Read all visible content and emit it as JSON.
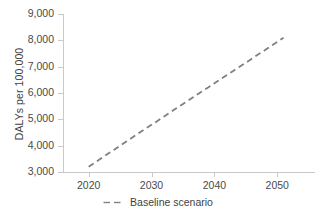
{
  "chart_data": {
    "type": "line",
    "title": "",
    "subtitle": "",
    "xlabel": "",
    "ylabel": "DALYs per 100,000",
    "xlim": [
      2016,
      2056
    ],
    "ylim": [
      3000,
      9000
    ],
    "grid": false,
    "legend_position": "bottom-center",
    "x_ticks": [
      2020,
      2030,
      2040,
      2050
    ],
    "x_tick_labels": [
      "2020",
      "2030",
      "2040",
      "2050"
    ],
    "y_ticks": [
      3000,
      4000,
      5000,
      6000,
      7000,
      8000,
      9000
    ],
    "y_tick_labels": [
      "3,000",
      "4,000",
      "5,000",
      "6,000",
      "7,000",
      "8,000",
      "9,000"
    ],
    "series": [
      {
        "name": "Baseline scenario",
        "style": "dashed",
        "color": "#808080",
        "x": [
          2020,
          2021,
          2022,
          2023,
          2024,
          2025,
          2026,
          2027,
          2028,
          2029,
          2030,
          2031,
          2032,
          2033,
          2034,
          2035,
          2036,
          2037,
          2038,
          2039,
          2040,
          2041,
          2042,
          2043,
          2044,
          2045,
          2046,
          2047,
          2048,
          2049,
          2050,
          2051
        ],
        "values": [
          3200,
          3360,
          3520,
          3680,
          3840,
          4000,
          4160,
          4320,
          4480,
          4640,
          4790,
          4950,
          5110,
          5270,
          5430,
          5580,
          5740,
          5900,
          6060,
          6210,
          6370,
          6530,
          6680,
          6840,
          7000,
          7150,
          7310,
          7470,
          7620,
          7780,
          7940,
          8100
        ]
      }
    ]
  },
  "legend": {
    "items": [
      {
        "label": "Baseline scenario",
        "color": "#808080"
      }
    ]
  },
  "axes": {
    "y_title": "DALYs per 100,000",
    "axis_color": "#c9c9c9",
    "label_color": "#4a4a4a"
  }
}
